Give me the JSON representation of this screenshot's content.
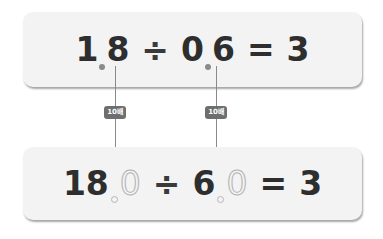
{
  "top_equation": {
    "dividend_int": "1",
    "dividend_frac": "8",
    "divide_sign": "÷",
    "divisor_int": "0",
    "divisor_frac": "6",
    "equals_sign": "=",
    "result": "3"
  },
  "bottom_equation": {
    "dividend_int": "18",
    "dividend_frac": "0",
    "divide_sign": "÷",
    "divisor_int": "6",
    "divisor_frac": "0",
    "equals_sign": "=",
    "result": "3"
  },
  "badges": [
    {
      "label": "10배"
    },
    {
      "label": "10배"
    }
  ],
  "colors": {
    "panel_bg": "#f3f3f3",
    "text": "#2e2e2e",
    "badge_bg": "#6e6e6e",
    "line": "#8a8a8a"
  }
}
